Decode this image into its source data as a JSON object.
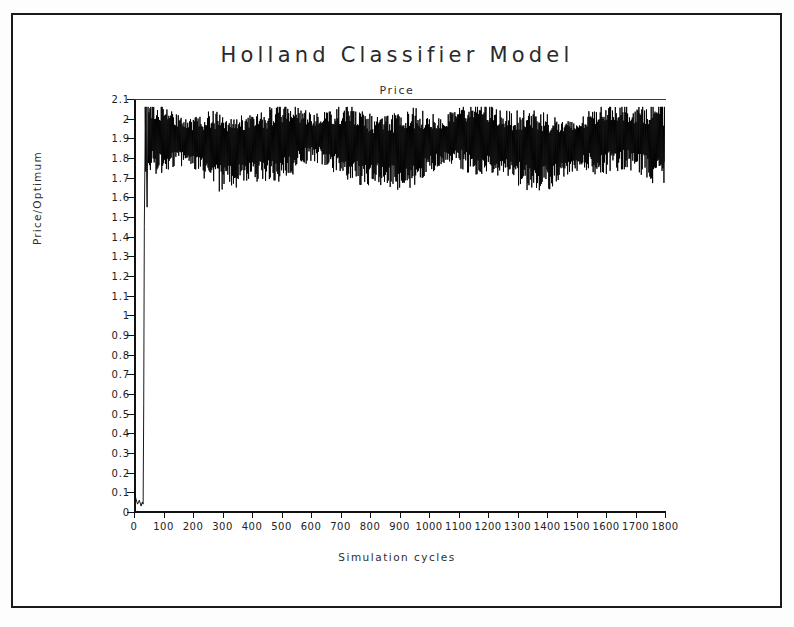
{
  "figure": {
    "title": "Holland Classifier Model",
    "subtitle": "Price"
  },
  "chart_data": {
    "type": "line",
    "title": "Holland Classifier Model",
    "subtitle": "Price",
    "xlabel": "Simulation cycles",
    "ylabel": "Price/Optimum",
    "xlim": [
      0,
      1800
    ],
    "ylim": [
      0,
      2.1
    ],
    "grid": false,
    "legend": null,
    "series_name": "Price",
    "line_color": "#000000",
    "xticks": [
      0,
      100,
      200,
      300,
      400,
      500,
      600,
      700,
      800,
      900,
      1000,
      1100,
      1200,
      1300,
      1400,
      1500,
      1600,
      1700,
      1800
    ],
    "xtick_labels": [
      "0",
      "100",
      "200",
      "300",
      "400",
      "500",
      "600",
      "700",
      "800",
      "900",
      "1000",
      "1100",
      "1200",
      "1300",
      "1400",
      "1500",
      "1600",
      "1700",
      "1800"
    ],
    "yticks": [
      0,
      0.1,
      0.2,
      0.3,
      0.4,
      0.5,
      0.6,
      0.7,
      0.8,
      0.9,
      1,
      1.1,
      1.2,
      1.3,
      1.4,
      1.5,
      1.6,
      1.7,
      1.8,
      1.9,
      2,
      2.1
    ],
    "ytick_labels": [
      "0",
      "0.1",
      "0.2",
      "0.3",
      "0.4",
      "0.5",
      "0.6",
      "0.7",
      "0.8",
      "0.9",
      "1",
      "1.1",
      "1.2",
      "1.3",
      "1.4",
      "1.5",
      "1.6",
      "1.7",
      "1.8",
      "1.9",
      "2",
      "2.1"
    ],
    "startup": {
      "x": [
        0,
        6,
        12,
        18,
        24,
        28,
        31,
        33,
        35,
        38
      ],
      "y": [
        0.11,
        0.07,
        0.04,
        0.06,
        0.03,
        0.05,
        0.04,
        0.55,
        1.45,
        1.95
      ]
    },
    "band": {
      "x_start": 38,
      "x_end": 1800,
      "y_min": 1.6,
      "y_max": 2.06,
      "y_mean": 1.87,
      "isolated_min": {
        "x": 45,
        "y": 1.55
      }
    }
  },
  "axes": {
    "x_title": "Simulation cycles",
    "y_title": "Price/Optimum"
  }
}
